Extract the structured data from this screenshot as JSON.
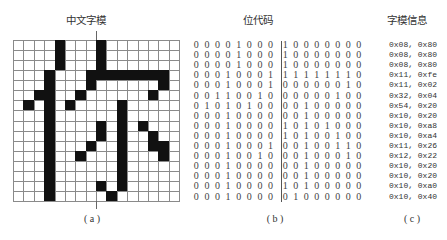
{
  "panels": {
    "a": {
      "title": "中文字模",
      "label": "(a)"
    },
    "b": {
      "title": "位代码",
      "label": "(b)"
    },
    "c": {
      "title": "字模信息",
      "label": "(c)"
    }
  },
  "bitmap": {
    "rows": 16,
    "cols": 16,
    "bits": [
      "0000100010000000",
      "0000100010000000",
      "0000100010000000",
      "0001000111111110",
      "0001000100000010",
      "0011001000000100",
      "0101010000100000",
      "0001000000100000",
      "0001000010101000",
      "0001000010100100",
      "0001000100100110",
      "0001001000100010",
      "0001000000100000",
      "0001000000100000",
      "0001000010100000",
      "0001000001000000"
    ]
  },
  "info": {
    "hex": [
      "0x08, 0x80",
      "0x08, 0x80",
      "0x08, 0x80",
      "0x11, 0xfe",
      "0x11, 0x02",
      "0x32, 0x04",
      "0x54, 0x20",
      "0x10, 0x20",
      "0x10, 0xa8",
      "0x10, 0xa4",
      "0x11, 0x26",
      "0x12, 0x22",
      "0x10, 0x20",
      "0x10, 0x20",
      "0x10, 0xa0",
      "0x10, 0x40"
    ]
  },
  "colors": {
    "filled_cell": "#111111",
    "grid_line": "#8a8a8a",
    "text": "#333333"
  }
}
